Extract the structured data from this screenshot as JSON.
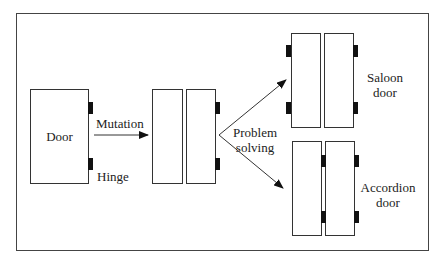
{
  "diagram": {
    "type": "concept-evolution",
    "nodes": [
      {
        "id": "door",
        "label": "Door",
        "hinge_label": "Hinge"
      },
      {
        "id": "split-door",
        "label": ""
      },
      {
        "id": "saloon",
        "label_line1": "Saloon",
        "label_line2": "door"
      },
      {
        "id": "accordion",
        "label_line1": "Accordion",
        "label_line2": "door"
      }
    ],
    "edges": [
      {
        "from": "door",
        "to": "split-door",
        "label": "Mutation"
      },
      {
        "from": "split-door",
        "to": "saloon",
        "label_line1": "Problem",
        "label_line2": "solving"
      },
      {
        "from": "split-door",
        "to": "accordion",
        "label_line1": "Problem",
        "label_line2": "solving"
      }
    ],
    "colors": {
      "stroke": "#333333",
      "hinge": "#111111",
      "background": "#ffffff"
    }
  }
}
